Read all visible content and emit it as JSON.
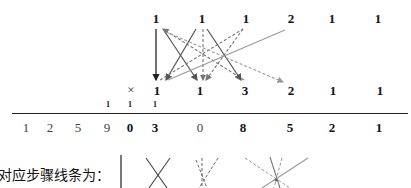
{
  "diagram": {
    "multiplicand": [
      "1",
      "1",
      "1",
      "2",
      "1",
      "1"
    ],
    "operator": "×",
    "multiplier": [
      "1",
      "1",
      "3",
      "2",
      "1",
      "1"
    ],
    "carries": [
      "1",
      "1",
      "1"
    ],
    "product": [
      "1",
      "2",
      "5",
      "9",
      "0",
      "3",
      "0",
      "8",
      "5",
      "2",
      "1"
    ],
    "caption": "对应步骤线条为：",
    "colors": {
      "solid_dark": "#222222",
      "solid_gray": "#555555",
      "dashed_gray": "#777777",
      "light_gray": "#999999"
    }
  }
}
